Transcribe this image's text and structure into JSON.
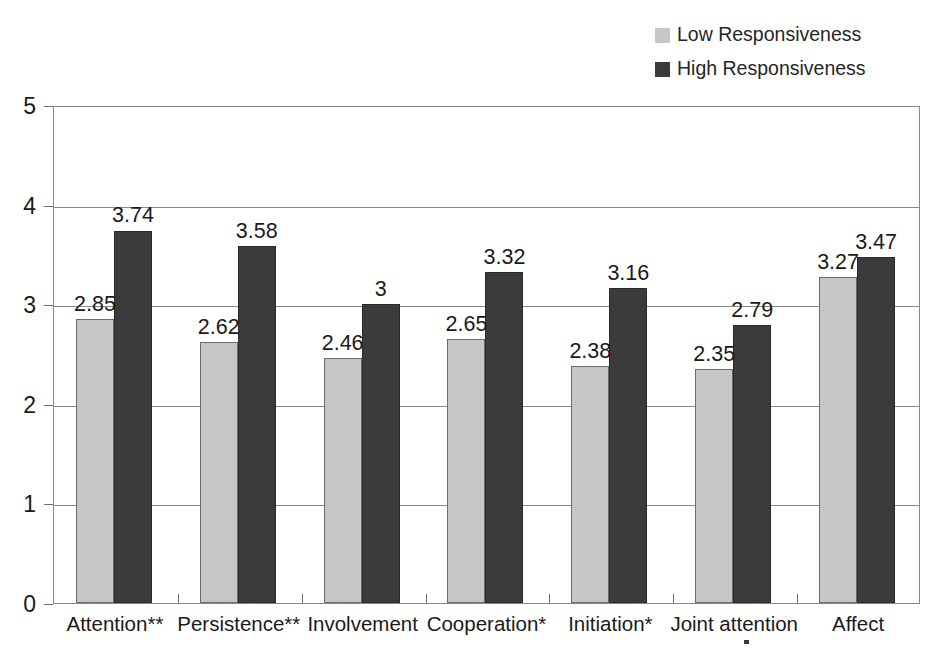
{
  "chart_data": {
    "type": "bar",
    "title": "",
    "subtitle": "",
    "xlabel": "",
    "ylabel": "",
    "ylim": [
      0,
      5
    ],
    "yticks": [
      0,
      1,
      2,
      3,
      4,
      5
    ],
    "grid": true,
    "legend_position": "top-right",
    "categories": [
      "Attention**",
      "Persistence**",
      "Involvement",
      "Cooperation*",
      "Initiation*",
      "Joint attention",
      "Affect"
    ],
    "series": [
      {
        "name": "Low Responsiveness",
        "color": "#c6c6c6",
        "values": [
          2.85,
          2.62,
          2.46,
          2.65,
          2.38,
          2.35,
          3.27
        ],
        "labels": [
          "2.85",
          "2.62",
          "2.46",
          "2.65",
          "2.38",
          "2.35",
          "3.27"
        ]
      },
      {
        "name": "High Responsiveness",
        "color": "#3b3b3b",
        "values": [
          3.74,
          3.58,
          3,
          3.32,
          3.16,
          2.79,
          3.47
        ],
        "labels": [
          "3.74",
          "3.58",
          "3",
          "3.32",
          "3.16",
          "2.79",
          "3.47"
        ]
      }
    ]
  },
  "legend": {
    "items": [
      {
        "label": "Low Responsiveness",
        "color": "#c6c6c6"
      },
      {
        "label": "High Responsiveness",
        "color": "#3b3b3b"
      }
    ]
  },
  "axes": {
    "y_tick_labels": [
      "5",
      "4",
      "3",
      "2",
      "1",
      "0"
    ],
    "x_tick_labels": [
      "Attention**",
      "Persistence**",
      "Involvement",
      "Cooperation*",
      "Initiation*",
      "Joint attention",
      "Affect"
    ]
  }
}
